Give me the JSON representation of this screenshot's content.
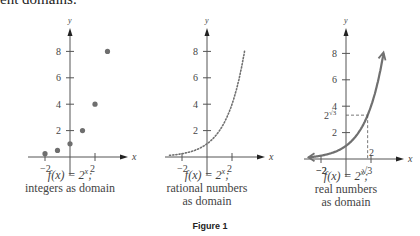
{
  "header": {
    "partial_text": "ent domains."
  },
  "figure_label": "Figure 1",
  "colors": {
    "axis": "#555555",
    "points": "#6e6e6e",
    "curve": "#707070",
    "text": "#444444"
  },
  "panels": [
    {
      "caption_line1": "f(x) = 2^x;",
      "caption_line2": "integers as domain",
      "caption_line3": ""
    },
    {
      "caption_line1": "f(x) = 2^x;",
      "caption_line2": "rational numbers",
      "caption_line3": "as domain"
    },
    {
      "caption_line1": "f(x) = 2^x;",
      "caption_line2": "real numbers",
      "caption_line3": "as domain"
    }
  ],
  "chart_data": [
    {
      "type": "scatter",
      "title": "f(x) = 2^x; integers as domain",
      "xlabel": "x",
      "ylabel": "y",
      "x": [
        -2,
        -1,
        0,
        1,
        2,
        3
      ],
      "y": [
        0.25,
        0.5,
        1,
        2,
        4,
        8
      ],
      "xticks": [
        -2,
        2
      ],
      "yticks": [
        2,
        4,
        6,
        8
      ],
      "xlim": [
        -3,
        3.5
      ],
      "ylim": [
        0,
        9.5
      ],
      "grid": false
    },
    {
      "type": "line",
      "style": "dotted",
      "title": "f(x) = 2^x; rational numbers as domain",
      "xlabel": "x",
      "ylabel": "y",
      "function": "2^x",
      "x_range": [
        -3,
        3
      ],
      "xticks": [
        -2,
        2
      ],
      "yticks": [
        2,
        4,
        6,
        8
      ],
      "xlim": [
        -3,
        3.5
      ],
      "ylim": [
        0,
        9.5
      ],
      "grid": false
    },
    {
      "type": "line",
      "style": "solid",
      "title": "f(x) = 2^x; real numbers as domain",
      "xlabel": "x",
      "ylabel": "y",
      "function": "2^x",
      "x_range": [
        -3,
        3
      ],
      "arrows": "both",
      "annotations": [
        {
          "type": "dashed-guide",
          "x": 1.732,
          "y": 3.322,
          "xlabel": "√3",
          "ylabel": "2^√3"
        }
      ],
      "xticks": [
        -2,
        2
      ],
      "yticks": [
        2,
        4,
        6,
        8
      ],
      "xlim": [
        -3,
        3.5
      ],
      "ylim": [
        0,
        9.5
      ],
      "grid": false
    }
  ],
  "axis_labels": {
    "x": "x",
    "y": "y",
    "t_neg2": "−2",
    "t_2": "2",
    "t_4": "4",
    "t_6": "6",
    "t_8": "8",
    "sqrt3": "√3",
    "two": "2"
  }
}
